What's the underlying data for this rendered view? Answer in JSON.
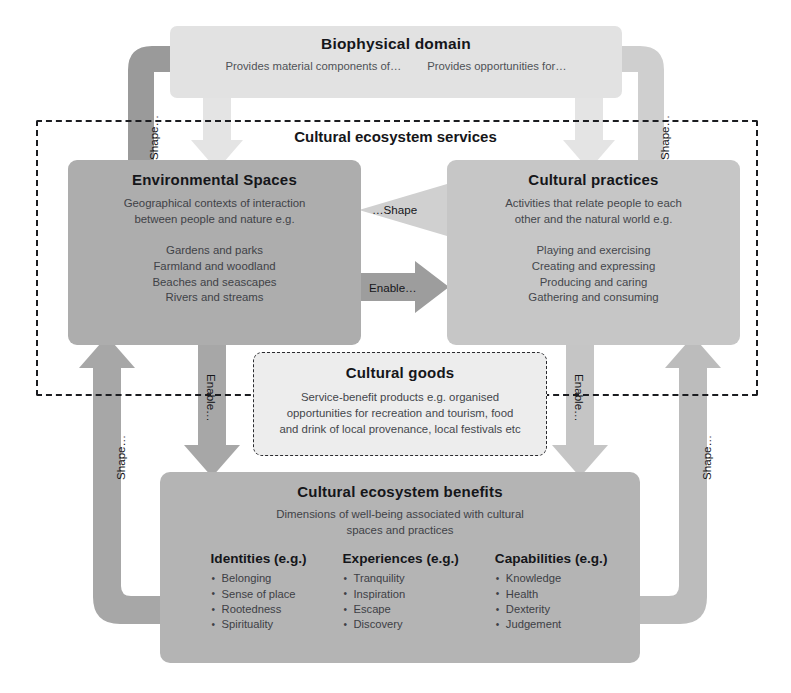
{
  "biophysical": {
    "title": "Biophysical domain",
    "provides_material": "Provides material components of…",
    "provides_opportunities": "Provides opportunities for…"
  },
  "ces": {
    "label": "Cultural ecosystem services"
  },
  "environmental_spaces": {
    "title": "Environmental Spaces",
    "description_line1": "Geographical contexts of interaction",
    "description_line2": "between people and nature e.g.",
    "examples": [
      "Gardens and parks",
      "Farmland and woodland",
      "Beaches and seascapes",
      "Rivers and streams"
    ]
  },
  "cultural_practices": {
    "title": "Cultural practices",
    "description_line1": "Activities that relate people to each",
    "description_line2": "other and the natural world e.g.",
    "examples": [
      "Playing and exercising",
      "Creating and expressing",
      "Producing and caring",
      "Gathering and consuming"
    ]
  },
  "cultural_goods": {
    "title": "Cultural goods",
    "description_line1": "Service-benefit products e.g. organised",
    "description_line2": "opportunities for recreation and tourism, food",
    "description_line3": "and drink of local provenance, local festivals etc"
  },
  "cultural_benefits": {
    "title": "Cultural ecosystem benefits",
    "description_line1": "Dimensions of well-being associated with cultural",
    "description_line2": "spaces and practices",
    "columns": [
      {
        "title": "Identities (e.g.)",
        "items": [
          "Belonging",
          "Sense of place",
          "Rootedness",
          "Spirituality"
        ]
      },
      {
        "title": "Experiences (e.g.)",
        "items": [
          "Tranquility",
          "Inspiration",
          "Escape",
          "Discovery"
        ]
      },
      {
        "title": "Capabilities (e.g.)",
        "items": [
          "Knowledge",
          "Health",
          "Dexterity",
          "Judgement"
        ]
      }
    ]
  },
  "arrows": {
    "shape_left_outer": "Shape…",
    "shape_right_outer": "Shape…",
    "shape_left_lower": "Shape…",
    "shape_right_lower": "Shape…",
    "shape_middle": "…Shape",
    "enable_middle": "Enable…",
    "enable_left": "Enable…",
    "enable_right": "Enable…"
  },
  "colors": {
    "biophysical_fill": "#e2e2e2",
    "environmental_spaces_fill": "#adadad",
    "cultural_practices_fill": "#c6c6c6",
    "cultural_goods_fill": "#ededed",
    "cultural_benefits_fill": "#b4b4b4",
    "arrow_dark": "#9a9a9a",
    "arrow_mid": "#b8b8b8",
    "arrow_light": "#dedede",
    "boundary_stroke": "#1b1c20"
  }
}
